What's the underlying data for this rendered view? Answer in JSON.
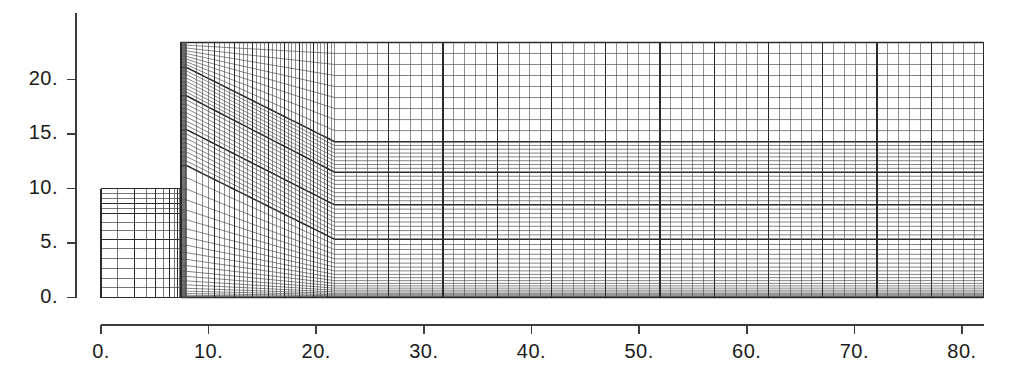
{
  "figure": {
    "kind": "computational-mesh-plot",
    "background_color": "#ffffff",
    "line_color": "#4a4a4a",
    "bold_line_color": "#2a2a2a",
    "axis_color": "#3c3c3c",
    "text_color": "#1b1b1b"
  },
  "axes": {
    "x": {
      "tick_labels": [
        "0.",
        "10.",
        "20.",
        "30.",
        "40.",
        "50.",
        "60.",
        "70.",
        "80."
      ],
      "tick_values": [
        0,
        10,
        20,
        30,
        40,
        50,
        60,
        70,
        80
      ],
      "range": [
        0,
        82
      ],
      "pixel_range": [
        101,
        962
      ],
      "axis_line_y": 325,
      "label_y": 340,
      "tick_length": 9
    },
    "y": {
      "tick_labels": [
        "0.",
        "5.",
        "10.",
        "15.",
        "20."
      ],
      "tick_values": [
        0,
        5,
        10,
        15,
        20
      ],
      "range": [
        0,
        24.6
      ],
      "pixel_range": [
        298,
        13
      ],
      "axis_line_x": 76,
      "label_x_right": 58,
      "tick_length": 9
    }
  },
  "chart_data": {
    "type": "mesh",
    "title": "",
    "xlabel": "",
    "ylabel": "",
    "xlim": [
      0,
      82
    ],
    "ylim": [
      0,
      24.6
    ],
    "grid": false,
    "blocks": [
      {
        "name": "left-shallow-block",
        "x_start": 0.0,
        "x_end": 7.45,
        "y_bottom": 0.0,
        "y_top": 10.0,
        "x_divisions": [
          0.0,
          1.55,
          3.1,
          4.2,
          5.1,
          5.85,
          6.4,
          6.8,
          7.1,
          7.28,
          7.38,
          7.45
        ],
        "y_layer_interfaces": [
          0.0,
          5.35,
          7.7,
          8.6,
          10.0
        ],
        "note": "Thin stepped block that terminates at the vertical fault/riser at x = 7.45"
      },
      {
        "name": "riser-transition-band",
        "x_start": 7.45,
        "x_end": 7.95,
        "y_bottom": 0.0,
        "y_top": 23.4,
        "note": "Very dense vertical column of compressed cells at the step"
      },
      {
        "name": "sloped-ramp-region",
        "x_start": 7.95,
        "x_end": 21.7,
        "y_bottom": 0.0,
        "y_top": 23.4,
        "note": "Layers dip from the crest at x = 7.95 down to the toe at x = 21.7"
      },
      {
        "name": "flat-right-basin",
        "x_start": 21.7,
        "x_end": 82.0,
        "y_bottom": 0.0,
        "y_top": 23.4,
        "note": "Horizontally layered basin, flat interfaces all the way to the right edge"
      }
    ],
    "layer_interfaces": [
      {
        "name": "interface-top-surface",
        "crest_y": 23.4,
        "toe_y": 23.4,
        "bold": true,
        "flat": true
      },
      {
        "name": "interface-1",
        "crest_y": 21.1,
        "toe_y": 14.3,
        "bold": true,
        "flat": false
      },
      {
        "name": "interface-2",
        "crest_y": 18.5,
        "toe_y": 11.5,
        "bold": true,
        "flat": false
      },
      {
        "name": "interface-3",
        "crest_y": 15.4,
        "toe_y": 8.5,
        "bold": true,
        "flat": false
      },
      {
        "name": "interface-4",
        "crest_y": 12.1,
        "toe_y": 5.35,
        "bold": true,
        "flat": false
      }
    ],
    "vertical_grid": {
      "left_block_count": 11,
      "ramp_count": 34,
      "basin_spacing_px": 10.85,
      "bold_every": 5
    },
    "horizontal_grid": {
      "top_band_count": 9,
      "mid_band_count": 8,
      "lower_band_count": 8,
      "basal_fine_count": 22,
      "note": "Cell height decreases strongly toward the base; the lowest ~1.5 units contain a dense stack of thin layers"
    }
  }
}
